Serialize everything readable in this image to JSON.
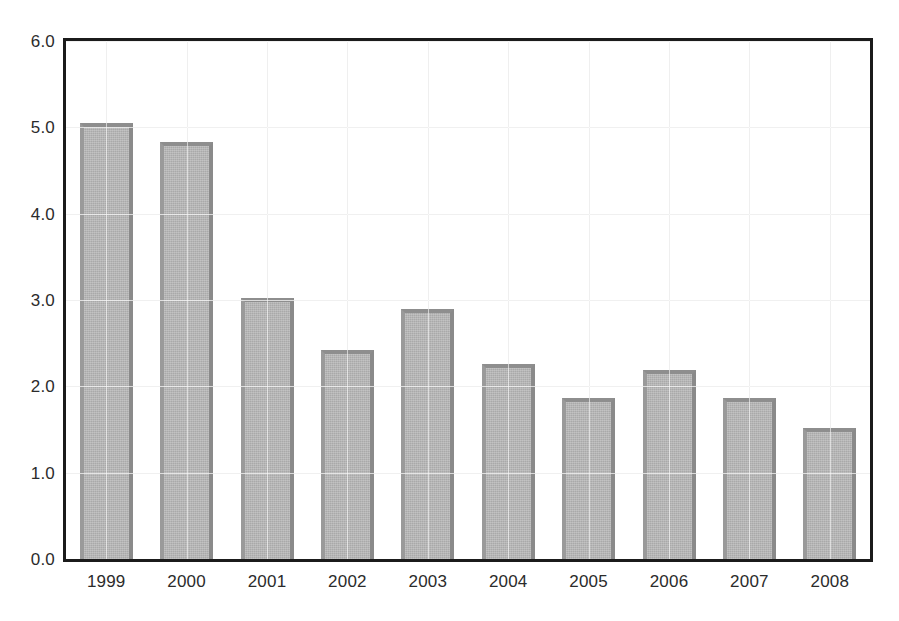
{
  "chart_data": {
    "type": "bar",
    "title": "",
    "subtitle": "",
    "xlabel": "",
    "ylabel": "",
    "categories": [
      "1999",
      "2000",
      "2001",
      "2002",
      "2003",
      "2004",
      "2005",
      "2006",
      "2007",
      "2008"
    ],
    "values": [
      5.05,
      4.83,
      3.02,
      2.42,
      2.9,
      2.26,
      1.86,
      2.19,
      1.87,
      1.52
    ],
    "ylim": [
      0.0,
      6.0
    ],
    "ytick_values": [
      0.0,
      1.0,
      2.0,
      3.0,
      4.0,
      5.0,
      6.0
    ],
    "ytick_labels": [
      "0.0",
      "1.0",
      "2.0",
      "3.0",
      "4.0",
      "5.0",
      "6.0"
    ],
    "xtick_labels": [
      "1999",
      "2000",
      "2001",
      "2002",
      "2003",
      "2004",
      "2005",
      "2006",
      "2007",
      "2008"
    ],
    "grid": true,
    "grid_axis": "both",
    "legend": null,
    "legend_position": "none",
    "annotations": [],
    "series": [
      {
        "name": "series-1",
        "values": [
          5.05,
          4.83,
          3.02,
          2.42,
          2.9,
          2.26,
          1.86,
          2.19,
          1.87,
          1.52
        ]
      }
    ],
    "colors": {
      "bar_fill": "#a9a9a9",
      "bar_edge": "#8b8b8b",
      "frame": "#1b1b1b",
      "gridline": "#d8d8d8",
      "tick_label": "#2b2b2b",
      "background": "#ffffff"
    }
  }
}
